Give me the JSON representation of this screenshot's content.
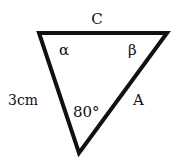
{
  "diagram": {
    "type": "triangle",
    "stroke_color": "#111111",
    "background": "#ffffff",
    "vertices": {
      "top_left": [
        39,
        33
      ],
      "top_right": [
        167,
        33
      ],
      "bottom": [
        79,
        153
      ]
    },
    "labels": {
      "side_top": "C",
      "side_left": "3cm",
      "side_right": "A",
      "angle_top_left": "α",
      "angle_top_right": "β",
      "angle_bottom": "80°"
    }
  }
}
